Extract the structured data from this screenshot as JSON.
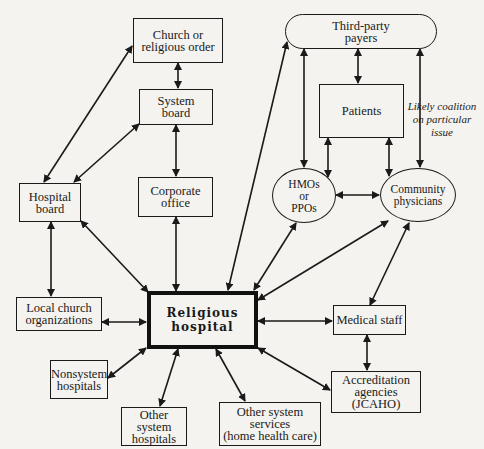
{
  "nodes": {
    "church": {
      "label": "Church or\nreligious order"
    },
    "system_board": {
      "label": "System\nboard"
    },
    "hospital_board": {
      "label": "Hospital\nboard"
    },
    "corporate_office": {
      "label": "Corporate\noffice"
    },
    "local_church": {
      "label": "Local church\norganizations"
    },
    "religious_hospital": {
      "label": "Religious\nhospital"
    },
    "nonsystem_hospitals": {
      "label": "Nonsystem\nhospitals"
    },
    "other_system_hospitals": {
      "label": "Other system\nhospitals"
    },
    "other_system_services": {
      "label": "Other system\nservices\n(home health care)"
    },
    "medical_staff": {
      "label": "Medical staff"
    },
    "accreditation": {
      "label": "Accreditation\nagencies\n(JCAHO)"
    },
    "third_party": {
      "label": "Third-party\npayers"
    },
    "patients": {
      "label": "Patients"
    },
    "hmos": {
      "label": "HMOs\nor\nPPOs"
    },
    "community_physicians": {
      "label": "Community\nphysicians"
    }
  },
  "annotation": {
    "label": "Likely coalition\non particular issue"
  },
  "colors": {
    "ink": "#1a1a1a",
    "paper": "#f4f3ef"
  }
}
